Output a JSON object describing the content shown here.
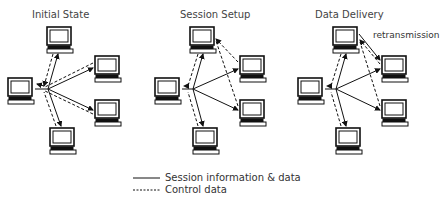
{
  "panels": [
    {
      "title": "Initial State"
    },
    {
      "title": "Session Setup"
    },
    {
      "title": "Data Delivery",
      "annotation": "retransmission"
    }
  ],
  "legend": {
    "solid": "Session information & data",
    "dashed": "Control data"
  }
}
